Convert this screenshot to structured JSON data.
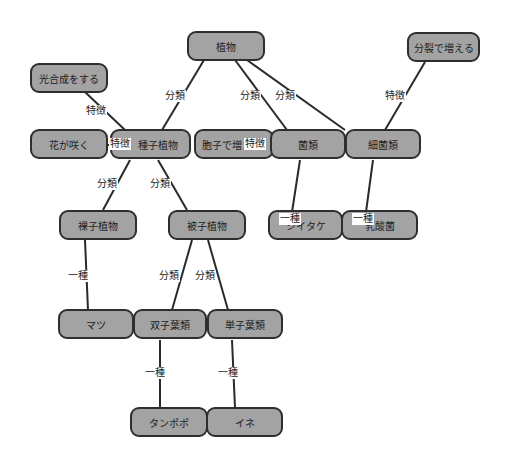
{
  "diagram": {
    "type": "concept-map",
    "nodes": {
      "plant": "植物",
      "photosynthesis": "光合成をする",
      "binary_fission": "分裂で増える",
      "flowers_bloom": "花が咲く",
      "seed_plants": "種子植物",
      "spores": "胞子で増える",
      "fungi": "菌類",
      "bacteria": "細菌類",
      "gymnosperms": "裸子植物",
      "angiosperms": "被子植物",
      "shiitake": "シイタケ",
      "lactic_bacteria": "乳酸菌",
      "pine": "マツ",
      "dicots": "双子葉類",
      "monocots": "単子葉類",
      "dandelion": "タンポポ",
      "rice": "イネ"
    },
    "edge_labels": {
      "classification": "分類",
      "feature": "特徴",
      "kind_of": "一種"
    },
    "edges": [
      {
        "from": "植物",
        "to": "種子植物",
        "label": "分類"
      },
      {
        "from": "植物",
        "to": "菌類",
        "label": "分類"
      },
      {
        "from": "植物",
        "to": "細菌類",
        "label": "分類"
      },
      {
        "from": "種子植物",
        "to": "光合成をする",
        "label": "特徴"
      },
      {
        "from": "種子植物",
        "to": "花が咲く",
        "label": "特徴"
      },
      {
        "from": "菌類",
        "to": "胞子で増える",
        "label": "特徴"
      },
      {
        "from": "細菌類",
        "to": "分裂で増える",
        "label": "特徴"
      },
      {
        "from": "種子植物",
        "to": "裸子植物",
        "label": "分類"
      },
      {
        "from": "種子植物",
        "to": "被子植物",
        "label": "分類"
      },
      {
        "from": "菌類",
        "to": "シイタケ",
        "label": "一種"
      },
      {
        "from": "細菌類",
        "to": "乳酸菌",
        "label": "一種"
      },
      {
        "from": "裸子植物",
        "to": "マツ",
        "label": "一種"
      },
      {
        "from": "被子植物",
        "to": "双子葉類",
        "label": "分類"
      },
      {
        "from": "被子植物",
        "to": "単子葉類",
        "label": "分類"
      },
      {
        "from": "双子葉類",
        "to": "タンポポ",
        "label": "一種"
      },
      {
        "from": "単子葉類",
        "to": "イネ",
        "label": "一種"
      }
    ],
    "colors": {
      "node_fill": "#a3a3a3",
      "node_border": "#2e2e2e",
      "line": "#2a2a2a",
      "background": "#ffffff"
    }
  }
}
